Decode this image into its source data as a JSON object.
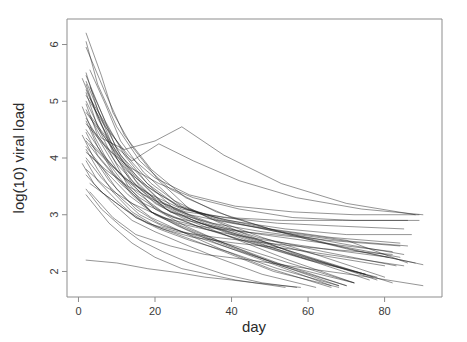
{
  "chart_data": {
    "type": "line",
    "title": "",
    "subtitle": "",
    "xlabel": "day",
    "ylabel": "log(10) viral load",
    "xlim": [
      -3,
      95
    ],
    "ylim": [
      1.55,
      6.45
    ],
    "xticks": [
      0,
      20,
      40,
      60,
      80
    ],
    "yticks": [
      2,
      3,
      4,
      5,
      6
    ],
    "xtick_labels": [
      "0",
      "20",
      "40",
      "60",
      "80"
    ],
    "ytick_labels": [
      "2",
      "3",
      "4",
      "5",
      "6"
    ],
    "grid": false,
    "legend": "none",
    "box": true,
    "line_color": "#1a1a1a",
    "background_color": "#ffffff",
    "n_series": 44,
    "series": [
      {
        "name": "subject-01",
        "x": [
          2,
          6,
          9,
          14,
          21,
          29,
          42,
          57,
          75
        ],
        "y": [
          6.2,
          5.45,
          4.8,
          4.2,
          3.6,
          3.1,
          2.7,
          2.3,
          1.95
        ]
      },
      {
        "name": "subject-02",
        "x": [
          2,
          5,
          10,
          16,
          24,
          36,
          50,
          68,
          84
        ],
        "y": [
          6.05,
          5.3,
          4.55,
          3.95,
          3.45,
          3.05,
          2.75,
          2.45,
          2.25
        ]
      },
      {
        "name": "subject-03",
        "x": [
          2,
          7,
          12,
          19,
          28,
          40,
          55,
          70,
          88
        ],
        "y": [
          5.95,
          5.15,
          4.4,
          3.8,
          3.3,
          2.95,
          2.65,
          2.4,
          2.15
        ]
      },
      {
        "name": "subject-04",
        "x": [
          3,
          7,
          11,
          17,
          25,
          34,
          48,
          62,
          80
        ],
        "y": [
          5.55,
          4.95,
          4.3,
          3.75,
          3.25,
          2.95,
          2.6,
          2.3,
          1.9
        ]
      },
      {
        "name": "subject-05",
        "x": [
          2,
          5,
          9,
          15,
          22,
          32,
          45,
          60,
          78
        ],
        "y": [
          5.5,
          4.85,
          4.2,
          3.65,
          3.2,
          2.9,
          2.6,
          2.25,
          1.85
        ]
      },
      {
        "name": "subject-06",
        "x": [
          2,
          6,
          10,
          16,
          23,
          33,
          46,
          63,
          82
        ],
        "y": [
          5.45,
          4.8,
          4.15,
          3.6,
          3.15,
          2.85,
          2.55,
          2.2,
          1.8
        ]
      },
      {
        "name": "subject-07",
        "x": [
          1,
          5,
          9,
          14,
          20,
          28,
          38,
          52,
          70
        ],
        "y": [
          5.4,
          4.75,
          4.1,
          3.55,
          3.1,
          2.8,
          2.5,
          2.15,
          1.75
        ]
      },
      {
        "name": "subject-08",
        "x": [
          2,
          6,
          11,
          18,
          26,
          37,
          52,
          68,
          85
        ],
        "y": [
          5.35,
          4.7,
          4.05,
          3.55,
          3.15,
          2.9,
          2.7,
          2.5,
          2.3
        ]
      },
      {
        "name": "subject-09",
        "x": [
          2,
          5,
          10,
          15,
          21,
          30,
          43,
          58,
          76
        ],
        "y": [
          5.3,
          4.7,
          4.1,
          3.6,
          3.2,
          2.9,
          2.6,
          2.25,
          1.85
        ]
      },
      {
        "name": "subject-10",
        "x": [
          3,
          7,
          12,
          18,
          25,
          35,
          47,
          64,
          83
        ],
        "y": [
          5.25,
          4.65,
          4.05,
          3.55,
          3.1,
          2.85,
          2.6,
          2.35,
          2.1
        ]
      },
      {
        "name": "subject-11",
        "x": [
          2,
          6,
          10,
          14,
          20,
          27,
          40,
          55,
          72
        ],
        "y": [
          5.2,
          4.6,
          4.0,
          3.6,
          3.2,
          2.95,
          2.6,
          2.2,
          1.8
        ]
      },
      {
        "name": "subject-12",
        "x": [
          2,
          5,
          9,
          13,
          19,
          26,
          36,
          50,
          66
        ],
        "y": [
          5.15,
          4.55,
          4.0,
          3.5,
          3.05,
          2.8,
          2.5,
          2.15,
          1.75
        ]
      },
      {
        "name": "subject-13",
        "x": [
          2,
          7,
          13,
          20,
          29,
          41,
          56,
          72,
          89
        ],
        "y": [
          5.1,
          4.55,
          4.05,
          3.65,
          3.35,
          3.15,
          3.05,
          3.0,
          3.0
        ]
      },
      {
        "name": "subject-14",
        "x": [
          3,
          8,
          13,
          19,
          27,
          38,
          52,
          68,
          86
        ],
        "y": [
          5.05,
          4.5,
          4.0,
          3.55,
          3.15,
          2.9,
          2.7,
          2.55,
          2.45
        ]
      },
      {
        "name": "subject-15",
        "x": [
          2,
          6,
          11,
          16,
          23,
          32,
          44,
          59,
          77
        ],
        "y": [
          5.0,
          4.45,
          3.95,
          3.5,
          3.1,
          2.85,
          2.55,
          2.25,
          1.9
        ]
      },
      {
        "name": "subject-16",
        "x": [
          2,
          5,
          10,
          16,
          24,
          35,
          48,
          65,
          84
        ],
        "y": [
          4.95,
          4.4,
          3.9,
          3.45,
          3.05,
          2.85,
          2.7,
          2.55,
          2.45
        ]
      },
      {
        "name": "subject-17",
        "x": [
          1,
          4,
          8,
          13,
          19,
          27,
          38,
          51,
          68
        ],
        "y": [
          4.9,
          4.4,
          3.9,
          3.45,
          3.05,
          2.8,
          2.5,
          2.15,
          1.75
        ]
      },
      {
        "name": "subject-18",
        "x": [
          2,
          6,
          12,
          20,
          27,
          38,
          53,
          70,
          88
        ],
        "y": [
          4.85,
          4.35,
          4.15,
          4.3,
          4.55,
          4.05,
          3.55,
          3.2,
          3.0
        ]
      },
      {
        "name": "subject-19",
        "x": [
          2,
          7,
          12,
          18,
          26,
          36,
          50,
          66,
          84
        ],
        "y": [
          4.8,
          4.35,
          3.9,
          3.5,
          3.15,
          2.95,
          2.75,
          2.6,
          2.5
        ]
      },
      {
        "name": "subject-20",
        "x": [
          3,
          8,
          14,
          21,
          30,
          42,
          57,
          74,
          90
        ],
        "y": [
          4.75,
          4.3,
          3.95,
          4.25,
          3.95,
          3.6,
          3.3,
          3.1,
          3.0
        ]
      },
      {
        "name": "subject-21",
        "x": [
          2,
          6,
          10,
          15,
          22,
          31,
          43,
          58,
          75
        ],
        "y": [
          4.7,
          4.25,
          3.8,
          3.4,
          3.05,
          2.8,
          2.55,
          2.25,
          1.95
        ]
      },
      {
        "name": "subject-22",
        "x": [
          2,
          5,
          9,
          14,
          20,
          28,
          39,
          53,
          70
        ],
        "y": [
          4.65,
          4.2,
          3.75,
          3.35,
          3.0,
          2.75,
          2.45,
          2.1,
          1.75
        ]
      },
      {
        "name": "subject-23",
        "x": [
          2,
          7,
          13,
          21,
          30,
          42,
          56,
          72,
          89
        ],
        "y": [
          4.6,
          4.2,
          3.85,
          3.55,
          3.3,
          3.1,
          2.95,
          2.9,
          2.9
        ]
      },
      {
        "name": "subject-24",
        "x": [
          3,
          8,
          13,
          20,
          28,
          39,
          54,
          70,
          87
        ],
        "y": [
          4.55,
          4.15,
          3.75,
          3.4,
          3.1,
          2.9,
          2.75,
          2.65,
          2.65
        ]
      },
      {
        "name": "subject-25",
        "x": [
          2,
          6,
          11,
          17,
          24,
          34,
          47,
          62,
          80
        ],
        "y": [
          4.5,
          4.1,
          3.7,
          3.35,
          3.05,
          2.8,
          2.55,
          2.3,
          2.1
        ]
      },
      {
        "name": "subject-26",
        "x": [
          2,
          5,
          10,
          16,
          23,
          33,
          45,
          60,
          78
        ],
        "y": [
          4.45,
          4.05,
          3.65,
          3.3,
          3.0,
          2.75,
          2.5,
          2.2,
          1.9
        ]
      },
      {
        "name": "subject-27",
        "x": [
          1,
          4,
          8,
          13,
          19,
          27,
          37,
          50,
          66
        ],
        "y": [
          4.4,
          4.0,
          3.6,
          3.25,
          2.95,
          2.7,
          2.4,
          2.05,
          1.72
        ]
      },
      {
        "name": "subject-28",
        "x": [
          2,
          7,
          12,
          19,
          27,
          38,
          52,
          68,
          85
        ],
        "y": [
          4.35,
          4.0,
          3.65,
          3.35,
          3.1,
          2.95,
          2.85,
          2.8,
          2.75
        ]
      },
      {
        "name": "subject-29",
        "x": [
          2,
          6,
          11,
          17,
          25,
          35,
          48,
          64,
          82
        ],
        "y": [
          4.3,
          3.95,
          3.55,
          3.2,
          2.95,
          2.8,
          2.65,
          2.5,
          2.35
        ]
      },
      {
        "name": "subject-30",
        "x": [
          3,
          8,
          14,
          21,
          29,
          40,
          54,
          70,
          86
        ],
        "y": [
          4.25,
          3.9,
          3.55,
          3.25,
          3.0,
          2.85,
          2.7,
          2.55,
          2.15
        ]
      },
      {
        "name": "subject-31",
        "x": [
          2,
          6,
          10,
          15,
          21,
          29,
          40,
          54,
          72
        ],
        "y": [
          4.2,
          3.85,
          3.45,
          3.1,
          2.85,
          2.65,
          2.4,
          2.1,
          1.8
        ]
      },
      {
        "name": "subject-32",
        "x": [
          2,
          5,
          9,
          14,
          20,
          28,
          38,
          51,
          68
        ],
        "y": [
          4.15,
          3.8,
          3.4,
          3.05,
          2.8,
          2.6,
          2.35,
          2.0,
          1.72
        ]
      },
      {
        "name": "subject-33",
        "x": [
          2,
          7,
          13,
          20,
          28,
          39,
          53,
          69,
          86
        ],
        "y": [
          4.1,
          3.8,
          3.5,
          3.25,
          3.05,
          2.95,
          2.9,
          2.9,
          2.9
        ]
      },
      {
        "name": "subject-34",
        "x": [
          3,
          8,
          13,
          19,
          26,
          36,
          49,
          64,
          81
        ],
        "y": [
          4.05,
          3.7,
          3.35,
          3.05,
          2.85,
          2.7,
          2.55,
          2.4,
          2.25
        ]
      },
      {
        "name": "subject-35",
        "x": [
          2,
          6,
          11,
          16,
          22,
          30,
          41,
          55,
          72
        ],
        "y": [
          4.0,
          3.65,
          3.3,
          3.0,
          2.8,
          2.65,
          2.45,
          2.15,
          1.8
        ]
      },
      {
        "name": "subject-36",
        "x": [
          2,
          5,
          10,
          15,
          21,
          29,
          39,
          52,
          68
        ],
        "y": [
          3.95,
          3.6,
          3.25,
          2.95,
          2.75,
          2.55,
          2.35,
          2.05,
          1.75
        ]
      },
      {
        "name": "subject-37",
        "x": [
          1,
          4,
          9,
          14,
          20,
          27,
          36,
          48,
          62
        ],
        "y": [
          3.9,
          3.55,
          3.2,
          2.9,
          2.7,
          2.5,
          2.25,
          1.95,
          1.72
        ]
      },
      {
        "name": "subject-38",
        "x": [
          2,
          7,
          14,
          22,
          31,
          43,
          58,
          74,
          90
        ],
        "y": [
          3.8,
          3.5,
          3.2,
          2.95,
          2.8,
          2.7,
          2.6,
          2.35,
          2.12
        ]
      },
      {
        "name": "subject-39",
        "x": [
          2,
          6,
          12,
          18,
          26,
          36,
          49,
          64,
          82
        ],
        "y": [
          3.7,
          3.4,
          3.1,
          2.85,
          2.7,
          2.6,
          2.5,
          2.4,
          2.3
        ]
      },
      {
        "name": "subject-40",
        "x": [
          3,
          9,
          15,
          22,
          30,
          41,
          55,
          70,
          85
        ],
        "y": [
          3.55,
          3.25,
          2.95,
          2.75,
          2.6,
          2.5,
          2.4,
          2.25,
          2.1
        ]
      },
      {
        "name": "subject-41",
        "x": [
          2,
          6,
          11,
          16,
          22,
          29,
          38,
          48,
          57
        ],
        "y": [
          3.45,
          3.1,
          2.8,
          2.55,
          2.35,
          2.15,
          1.95,
          1.8,
          1.72
        ]
      },
      {
        "name": "subject-42",
        "x": [
          3,
          9,
          15,
          24,
          33,
          45,
          60,
          76,
          90
        ],
        "y": [
          3.4,
          2.95,
          2.65,
          2.45,
          2.3,
          2.2,
          2.05,
          1.9,
          1.75
        ]
      },
      {
        "name": "subject-43",
        "x": [
          2,
          8,
          14,
          20,
          27,
          34,
          41,
          48,
          54
        ],
        "y": [
          3.35,
          2.85,
          2.5,
          2.25,
          2.05,
          1.95,
          1.85,
          1.78,
          1.72
        ]
      },
      {
        "name": "subject-44",
        "x": [
          2,
          10,
          18,
          26,
          33,
          40,
          46,
          52,
          58
        ],
        "y": [
          2.2,
          2.15,
          2.05,
          1.98,
          1.9,
          1.85,
          1.8,
          1.76,
          1.72
        ]
      }
    ]
  },
  "axes": {
    "x_title": "day",
    "y_title": "log(10) viral load"
  }
}
